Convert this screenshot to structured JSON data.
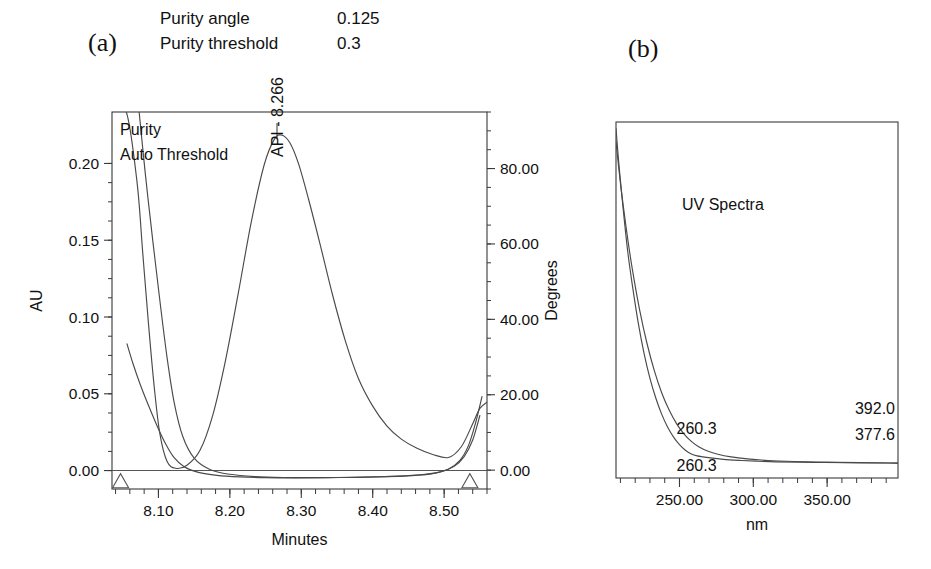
{
  "panels": {
    "a_label": "(a)",
    "b_label": "(b)"
  },
  "parameters": [
    {
      "label": "Purity angle",
      "value": "0.125"
    },
    {
      "label": "Purity threshold",
      "value": "0.3"
    }
  ],
  "chart_data": [
    {
      "id": "chromatogram-purity",
      "type": "line",
      "title": "",
      "panel": "(a)",
      "xlabel": "Minutes",
      "ylabel": "AU",
      "y2label": "Degrees",
      "xlim": [
        8.035,
        8.56
      ],
      "ylim": [
        -0.012,
        0.2335
      ],
      "y2lim": [
        -5.0,
        95.0
      ],
      "xticks": [
        "8.10",
        "8.20",
        "8.30",
        "8.40",
        "8.50"
      ],
      "xtick_values": [
        8.1,
        8.2,
        8.3,
        8.4,
        8.5
      ],
      "xminor_step": 0.02,
      "yticks": [
        "0.00",
        "0.05",
        "0.10",
        "0.15",
        "0.20"
      ],
      "ytick_values": [
        0.0,
        0.05,
        0.1,
        0.15,
        0.2
      ],
      "yminor_step": 0.0125,
      "y2ticks": [
        "0.00",
        "20.00",
        "40.00",
        "60.00",
        "80.00"
      ],
      "y2tick_values": [
        0.0,
        20.0,
        40.0,
        60.0,
        80.0
      ],
      "y2minor_step": 5.0,
      "grid": false,
      "legend_position": "top-left-inside",
      "legend": [
        "Purity",
        "Auto Threshold"
      ],
      "annotations": [
        {
          "text": "API - 8.266",
          "x": 8.266,
          "y": 0.2185,
          "rotation": -90
        }
      ],
      "peak": {
        "label": "API",
        "retention_time": 8.266,
        "apex_au": 0.2185
      },
      "integration_markers": [
        {
          "type": "triangle",
          "x": 8.047,
          "y": -0.004
        },
        {
          "type": "triangle",
          "x": 8.536,
          "y": -0.004
        }
      ],
      "series": [
        {
          "name": "Chromatogram (AU)",
          "axis": "left",
          "x": [
            8.035,
            8.055,
            8.07,
            8.078,
            8.086,
            8.094,
            8.102,
            8.112,
            8.124,
            8.14,
            8.158,
            8.176,
            8.194,
            8.212,
            8.23,
            8.248,
            8.262,
            8.272,
            8.284,
            8.296,
            8.31,
            8.326,
            8.344,
            8.362,
            8.38,
            8.4,
            8.42,
            8.44,
            8.462,
            8.484,
            8.506,
            8.524,
            8.54,
            8.55,
            8.56
          ],
          "y": [
            0.2335,
            0.2335,
            0.188,
            0.142,
            0.096,
            0.055,
            0.024,
            0.006,
            0.0015,
            0.0035,
            0.013,
            0.036,
            0.072,
            0.116,
            0.162,
            0.199,
            0.2155,
            0.2185,
            0.2135,
            0.2,
            0.177,
            0.148,
            0.114,
            0.084,
            0.06,
            0.042,
            0.029,
            0.0205,
            0.0145,
            0.0105,
            0.0085,
            0.0155,
            0.0305,
            0.0405,
            0.0445
          ]
        },
        {
          "name": "Purity",
          "axis": "right",
          "x": [
            8.056,
            8.064,
            8.074,
            8.086,
            8.098,
            8.11,
            8.122,
            8.136,
            8.156,
            8.182,
            8.214,
            8.25,
            8.29,
            8.33,
            8.37,
            8.41,
            8.45,
            8.482,
            8.506,
            8.522,
            8.534,
            8.544,
            8.553
          ],
          "y": [
            33.5,
            28.5,
            23.0,
            17.2,
            11.8,
            7.0,
            3.3,
            0.9,
            -0.6,
            -1.4,
            -1.8,
            -2.0,
            -2.05,
            -2.0,
            -1.9,
            -1.75,
            -1.5,
            -1.0,
            0.3,
            2.6,
            6.5,
            12.5,
            19.5
          ]
        },
        {
          "name": "Auto Threshold",
          "axis": "right",
          "x": [
            8.073,
            8.082,
            8.092,
            8.102,
            8.112,
            8.122,
            8.134,
            8.15,
            8.172,
            8.2,
            8.235,
            8.275,
            8.315,
            8.355,
            8.395,
            8.435,
            8.47,
            8.496,
            8.514,
            8.528,
            8.54,
            8.55
          ],
          "y": [
            95.0,
            78.0,
            61.0,
            45.0,
            30.0,
            18.0,
            9.0,
            3.2,
            0.2,
            -1.1,
            -1.7,
            -1.95,
            -2.0,
            -1.95,
            -1.85,
            -1.6,
            -1.15,
            -0.4,
            1.0,
            3.6,
            8.0,
            14.5
          ]
        }
      ]
    },
    {
      "id": "uv-spectra",
      "type": "line",
      "panel": "(b)",
      "title": "UV Spectra",
      "xlabel": "nm",
      "ylabel": "",
      "xlim": [
        207.0,
        398.0
      ],
      "ylim": [
        -0.02,
        1.06
      ],
      "xticks": [
        "250.00",
        "300.00",
        "350.00"
      ],
      "xtick_values": [
        250.0,
        300.0,
        350.0
      ],
      "xminor_step": 10.0,
      "grid": false,
      "legend_position": "none",
      "annotations": [
        {
          "text": "260.3",
          "nm": 260.3,
          "position": "upper-left-baseline"
        },
        {
          "text": "260.3",
          "nm": 260.3,
          "position": "lower-left-baseline"
        },
        {
          "text": "392.0",
          "nm": 392.0,
          "position": "upper-right"
        },
        {
          "text": "377.6",
          "nm": 377.6,
          "position": "lower-right"
        }
      ],
      "series": [
        {
          "name": "UV spectrum",
          "x": [
            207.0,
            209.0,
            212.0,
            215.0,
            218.5,
            222.0,
            226.0,
            230.0,
            234.0,
            238.0,
            242.0,
            246.0,
            250.0,
            254.0,
            258.0,
            262.0,
            266.0,
            271.0,
            277.0,
            284.0,
            292.0,
            302.0,
            315.0,
            330.0,
            348.0,
            365.0,
            380.0,
            392.0,
            398.0
          ],
          "y": [
            1.04,
            0.93,
            0.79,
            0.665,
            0.552,
            0.452,
            0.358,
            0.282,
            0.222,
            0.173,
            0.134,
            0.104,
            0.081,
            0.064,
            0.053,
            0.047,
            0.044,
            0.041,
            0.038,
            0.035,
            0.033,
            0.031,
            0.029,
            0.028,
            0.027,
            0.0265,
            0.026,
            0.0255,
            0.025
          ]
        },
        {
          "name": "UV spectrum overlay",
          "x": [
            207.0,
            210.0,
            214.0,
            218.0,
            223.0,
            228.0,
            233.0,
            238.0,
            243.0,
            248.0,
            253.0,
            258.0,
            263.0,
            269.0,
            276.0,
            285.0,
            296.0,
            310.0,
            328.0,
            350.0,
            372.0,
            392.0,
            398.0
          ],
          "y": [
            1.0,
            0.875,
            0.735,
            0.615,
            0.49,
            0.388,
            0.305,
            0.238,
            0.186,
            0.145,
            0.114,
            0.091,
            0.075,
            0.062,
            0.052,
            0.044,
            0.038,
            0.033,
            0.03,
            0.028,
            0.0265,
            0.0255,
            0.025
          ]
        }
      ]
    }
  ]
}
